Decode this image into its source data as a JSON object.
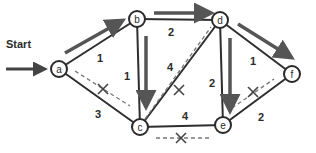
{
  "colors": {
    "edge": "#2e2e2e",
    "arrow": "#555555",
    "dashed": "#777777",
    "node_fill": "#ffffff",
    "node_stroke": "#2a2a2a",
    "text": "#2b2b2b"
  },
  "start": {
    "label": "Start",
    "target": "a"
  },
  "nodes": [
    {
      "id": "a",
      "label": "a",
      "x": 59,
      "y": 69
    },
    {
      "id": "b",
      "label": "b",
      "x": 137,
      "y": 19
    },
    {
      "id": "c",
      "label": "c",
      "x": 140,
      "y": 127
    },
    {
      "id": "d",
      "label": "d",
      "x": 220,
      "y": 20
    },
    {
      "id": "e",
      "label": "e",
      "x": 223,
      "y": 125
    },
    {
      "id": "f",
      "label": "f",
      "x": 292,
      "y": 74
    }
  ],
  "edges": [
    {
      "from": "a",
      "to": "b",
      "weight": "1",
      "label_x": 100,
      "label_y": 62,
      "path": true,
      "rejected": false
    },
    {
      "from": "a",
      "to": "c",
      "weight": "3",
      "label_x": 98,
      "label_y": 118,
      "path": false,
      "rejected": true
    },
    {
      "from": "b",
      "to": "c",
      "weight": "1",
      "label_x": 127,
      "label_y": 80,
      "path": true,
      "rejected": false
    },
    {
      "from": "b",
      "to": "d",
      "weight": "2",
      "label_x": 171,
      "label_y": 36,
      "path": true,
      "rejected": false
    },
    {
      "from": "c",
      "to": "d",
      "weight": "4",
      "label_x": 170,
      "label_y": 71,
      "path": false,
      "rejected": true
    },
    {
      "from": "c",
      "to": "e",
      "weight": "4",
      "label_x": 185,
      "label_y": 120,
      "path": false,
      "rejected": true
    },
    {
      "from": "d",
      "to": "e",
      "weight": "2",
      "label_x": 212,
      "label_y": 87,
      "path": true,
      "rejected": false
    },
    {
      "from": "d",
      "to": "f",
      "weight": "1",
      "label_x": 253,
      "label_y": 65,
      "path": true,
      "rejected": false
    },
    {
      "from": "e",
      "to": "f",
      "weight": "2",
      "label_x": 261,
      "label_y": 121,
      "path": false,
      "rejected": true
    }
  ],
  "path_arrows": [
    {
      "name": "arrow-a-b",
      "x1": 65,
      "y1": 53,
      "x2": 120,
      "y2": 22
    },
    {
      "name": "arrow-b-c",
      "x1": 146,
      "y1": 36,
      "x2": 146,
      "y2": 104
    },
    {
      "name": "arrow-b-d",
      "x1": 154,
      "y1": 13,
      "x2": 208,
      "y2": 13
    },
    {
      "name": "arrow-d-e",
      "x1": 230,
      "y1": 38,
      "x2": 230,
      "y2": 108
    },
    {
      "name": "arrow-d-f",
      "x1": 238,
      "y1": 24,
      "x2": 289,
      "y2": 56
    }
  ],
  "rejected_marks": [
    {
      "name": "rejected-a-c",
      "x1": 75,
      "y1": 71,
      "x2": 130,
      "y2": 106,
      "cx": 103,
      "cy": 89
    },
    {
      "name": "rejected-c-d",
      "x1": 145,
      "y1": 119,
      "x2": 211,
      "y2": 27,
      "cx": 179,
      "cy": 90
    },
    {
      "name": "rejected-c-e",
      "x1": 156,
      "y1": 138,
      "x2": 209,
      "y2": 138,
      "cx": 181,
      "cy": 138
    },
    {
      "name": "rejected-e-f",
      "x1": 232,
      "y1": 108,
      "x2": 274,
      "y2": 79,
      "cx": 253,
      "cy": 92
    }
  ]
}
